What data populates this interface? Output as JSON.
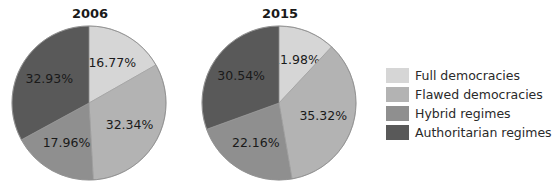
{
  "chart_data": [
    {
      "type": "pie",
      "title": "2006",
      "categories": [
        "Full democracies",
        "Flawed democracies",
        "Hybrid regimes",
        "Authoritarian regimes"
      ],
      "values": [
        16.77,
        32.34,
        17.96,
        32.93
      ],
      "labels": [
        "16.77%",
        "32.34%",
        "17.96%",
        "32.93%"
      ],
      "start_angle": "12 o'clock",
      "direction": "clockwise"
    },
    {
      "type": "pie",
      "title": "2015",
      "categories": [
        "Full democracies",
        "Flawed democracies",
        "Hybrid regimes",
        "Authoritarian regimes"
      ],
      "values": [
        11.98,
        35.32,
        22.16,
        30.54
      ],
      "labels": [
        "11.98%",
        "35.32%",
        "22.16%",
        "30.54%"
      ],
      "start_angle": "12 o'clock",
      "direction": "clockwise"
    }
  ],
  "pies": [
    {
      "title": "2006",
      "cx": 89,
      "cy": 103,
      "r": 77
    },
    {
      "title": "2015",
      "cx": 279,
      "cy": 103,
      "r": 77
    }
  ],
  "legend": {
    "position": "right",
    "items": [
      {
        "label": "Full democracies",
        "color": "#d6d6d6"
      },
      {
        "label": "Flawed democracies",
        "color": "#b3b3b3"
      },
      {
        "label": "Hybrid regimes",
        "color": "#8f8f8f"
      },
      {
        "label": "Authoritarian regimes",
        "color": "#595959"
      }
    ]
  }
}
